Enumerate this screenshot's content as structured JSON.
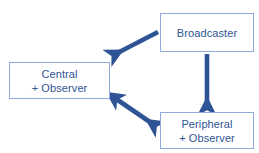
{
  "diagram": {
    "background_color": "#ffffff",
    "box_border_color": "#8faadc",
    "text_color": "#2f5496",
    "arrow_color": "#2f5496",
    "nodes": [
      {
        "id": "broadcaster",
        "lines": [
          "Broadcaster"
        ],
        "line1": "Broadcaster",
        "line2": ""
      },
      {
        "id": "central",
        "lines": [
          "Central",
          "+ Observer"
        ],
        "line1": "Central",
        "line2": "+ Observer"
      },
      {
        "id": "peripheral",
        "lines": [
          "Peripheral",
          "+ Observer"
        ],
        "line1": "Peripheral",
        "line2": "+ Observer"
      }
    ],
    "edges": [
      {
        "id": "broadcaster-to-central",
        "from": "broadcaster",
        "to": "central",
        "direction": "one-way",
        "label": ""
      },
      {
        "id": "broadcaster-to-peripheral",
        "from": "broadcaster",
        "to": "peripheral",
        "direction": "one-way",
        "label": ""
      },
      {
        "id": "central-peripheral-bidirectional",
        "from": "central",
        "to": "peripheral",
        "direction": "two-way",
        "label": ""
      }
    ]
  }
}
